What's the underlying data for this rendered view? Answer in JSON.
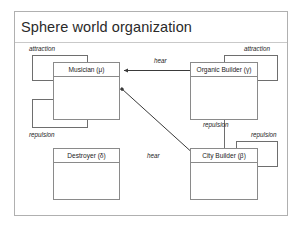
{
  "slide": {
    "title": "Sphere world organization"
  },
  "nodes": [
    {
      "id": "musician",
      "label": "Musician (μ)"
    },
    {
      "id": "organic-builder",
      "label": "Organic Builder (γ)"
    },
    {
      "id": "destroyer",
      "label": "Destroyer (δ)"
    },
    {
      "id": "city-builder",
      "label": "City Builder (β)"
    }
  ],
  "edge_labels": [
    {
      "id": "attraction-musician",
      "text": "attraction"
    },
    {
      "id": "attraction-organic",
      "text": "attraction"
    },
    {
      "id": "repulsion-musician",
      "text": "repulsion"
    },
    {
      "id": "repulsion-organic-city",
      "text": "repulsion"
    },
    {
      "id": "repulsion-city",
      "text": "repulsion"
    },
    {
      "id": "hear-organic-musician",
      "text": "hear"
    },
    {
      "id": "hear-city-musician",
      "text": "hear"
    }
  ],
  "colors": {
    "frame_border": "#b0b0b0",
    "node_border": "#8a8a8a",
    "connector": "#6e6e6e",
    "arrow": "#3a3a3a",
    "text": "#1c1c1c",
    "title_text": "#2a2a2a",
    "background": "#ffffff"
  }
}
